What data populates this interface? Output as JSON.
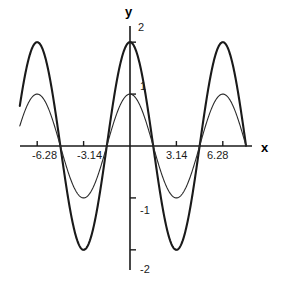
{
  "chart_data": {
    "type": "line",
    "title": "",
    "xlabel": "x",
    "ylabel": "y",
    "xlim": [
      -7.85,
      7.85
    ],
    "ylim": [
      -2.35,
      2.35
    ],
    "grid": false,
    "legend": "none",
    "x_ticks": [
      {
        "value": -6.28,
        "label": "-6.28"
      },
      {
        "value": -3.14,
        "label": "-3.14"
      },
      {
        "value": 3.14,
        "label": "3.14"
      },
      {
        "value": 6.28,
        "label": "6.28"
      }
    ],
    "y_ticks": [
      {
        "value": 2,
        "label": "2"
      },
      {
        "value": 1,
        "label": "1"
      },
      {
        "value": -1,
        "label": "-1"
      },
      {
        "value": -2,
        "label": "-2"
      }
    ],
    "series": [
      {
        "name": "y = 2 cos(x)",
        "amplitude": 2,
        "period": 6.283185307179586,
        "phase": 0,
        "color": "#1a1a1a",
        "width": 2.1,
        "x": [
          -7.85,
          -7.0,
          -6.28,
          -5.5,
          -4.71,
          -3.93,
          -3.14,
          -2.36,
          -1.57,
          -0.79,
          0,
          0.79,
          1.57,
          2.36,
          3.14,
          3.93,
          4.71,
          5.5,
          6.28,
          7.0,
          7.85
        ],
        "values": [
          0,
          1.51,
          2,
          1.42,
          0,
          -1.42,
          -2,
          -1.42,
          0,
          1.42,
          2,
          1.42,
          0,
          -1.42,
          -2,
          -1.42,
          0,
          1.42,
          2,
          1.51,
          0
        ]
      },
      {
        "name": "y = cos(x)",
        "amplitude": 1,
        "period": 6.283185307179586,
        "phase": 0,
        "color": "#2b2b2b",
        "width": 1.1,
        "x": [
          -7.85,
          -7.0,
          -6.28,
          -5.5,
          -4.71,
          -3.93,
          -3.14,
          -2.36,
          -1.57,
          -0.79,
          0,
          0.79,
          1.57,
          2.36,
          3.14,
          3.93,
          4.71,
          5.5,
          6.28,
          7.0,
          7.85
        ],
        "values": [
          0,
          0.75,
          1,
          0.71,
          0,
          -0.71,
          -1,
          -0.71,
          0,
          0.71,
          1,
          0.71,
          0,
          -0.71,
          -1,
          -0.71,
          0,
          0.71,
          1,
          0.75,
          0
        ]
      }
    ],
    "axis_color": "#1a1a1a"
  },
  "labels": {
    "y_axis_title": "y",
    "x_axis_title": "x",
    "tick_2": "2",
    "tick_1": "1",
    "tick_neg1": "-1",
    "tick_neg2": "-2",
    "tick_neg628": "-6.28",
    "tick_neg314": "-3.14",
    "tick_314": "3.14",
    "tick_628": "6.28"
  }
}
